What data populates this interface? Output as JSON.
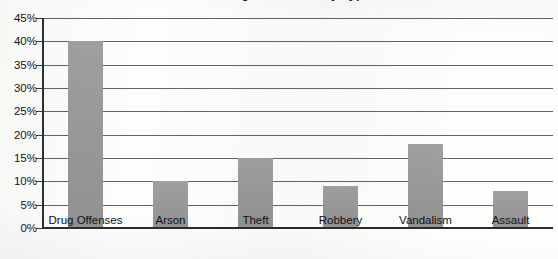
{
  "chart_data": {
    "type": "bar",
    "title": "Percentage of Crimes by Type",
    "title_clipped": true,
    "xlabel": "",
    "ylabel": "",
    "categories": [
      "Drug Offenses",
      "Arson",
      "Theft",
      "Robbery",
      "Vandalism",
      "Assault"
    ],
    "values": [
      40,
      10,
      15,
      9,
      18,
      8
    ],
    "value_labels": [
      "40%",
      "10%",
      "15%",
      "9%",
      "18%",
      "8%"
    ],
    "ylim": [
      0,
      45
    ],
    "ytick_step": 5,
    "ytick_labels": [
      "45%",
      "40%",
      "35%",
      "30%",
      "25%",
      "20%",
      "15%",
      "10%",
      "5%",
      "0%"
    ],
    "ytick_values": [
      45,
      40,
      35,
      30,
      25,
      20,
      15,
      10,
      5,
      0
    ],
    "grid": true,
    "grid_axis": "y",
    "legend": false,
    "legend_position": "none",
    "bar_color": "#9a9a9a",
    "gridline_color": "#636363",
    "axis_color": "#2e2e2e",
    "background_color": "#fdfdfc",
    "text_color": "#141414"
  }
}
